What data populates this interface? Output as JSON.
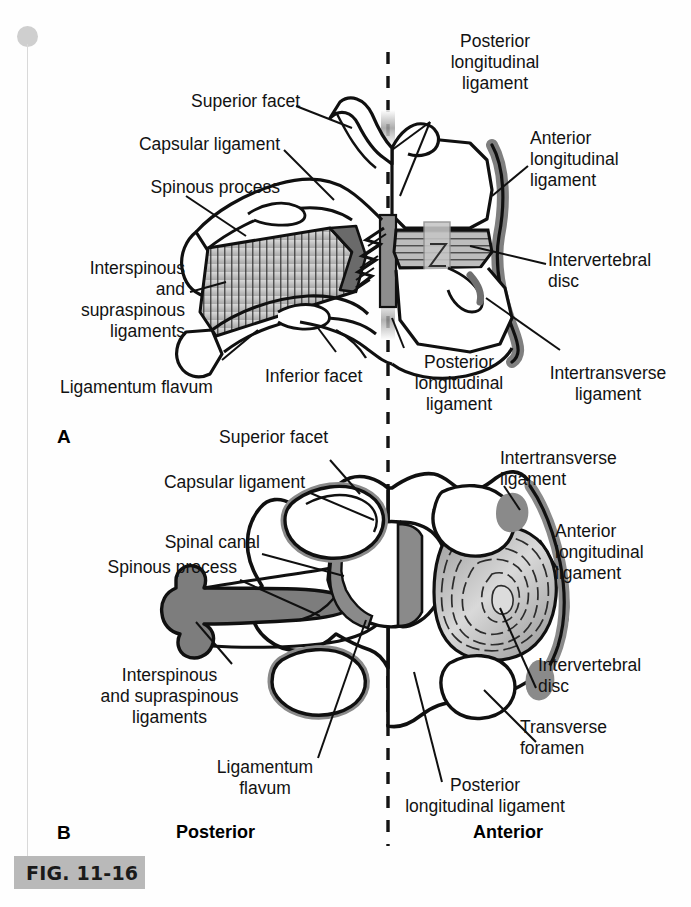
{
  "figure": {
    "caption_tag": "FIG. 11-16",
    "panels": [
      {
        "letter": "A",
        "view": "lateral (sagittal) view of two vertebrae and their ligaments"
      },
      {
        "letter": "B",
        "view": "superior (axial/transverse) view of a cervical vertebra and its ligaments"
      }
    ],
    "midline_note": "vertical dashed line divides posterior (left) from anterior (right)"
  },
  "orientation": {
    "posterior": "Posterior",
    "anterior": "Anterior"
  },
  "panel_a": {
    "letter": "A",
    "labels": {
      "superior_facet": "Superior facet",
      "capsular_ligament": "Capsular ligament",
      "spinous_process": "Spinous process",
      "interspinous_supraspinous": "Interspinous\nand\nsupraspinous\nligaments",
      "ligamentum_flavum": "Ligamentum flavum",
      "inferior_facet": "Inferior facet",
      "posterior_longitudinal_top": "Posterior\nlongitudinal\nligament",
      "posterior_longitudinal_bottom": "Posterior\nlongitudinal\nligament",
      "anterior_longitudinal": "Anterior\nlongitudinal\nligament",
      "intervertebral_disc": "Intervertebral\ndisc",
      "intertransverse_ligament": "Intertransverse\nligament"
    }
  },
  "panel_b": {
    "letter": "B",
    "labels": {
      "superior_facet": "Superior facet",
      "capsular_ligament": "Capsular ligament",
      "spinal_canal": "Spinal canal",
      "spinous_process": "Spinous process",
      "interspinous_supraspinous": "Interspinous\nand supraspinous\nligaments",
      "ligamentum_flavum": "Ligamentum\nflavum",
      "intertransverse_ligament": "Intertransverse\nligament",
      "anterior_longitudinal": "Anterior\nlongitudinal\nligament",
      "intervertebral_disc": "Intervertebral\ndisc",
      "transverse_foramen": "Transverse\nforamen",
      "posterior_longitudinal": "Posterior\nlongitudinal ligament"
    }
  },
  "colors": {
    "ink": "#111111",
    "page": "#ffffff",
    "caption_bar": "#b9b9b9",
    "rail": "#d9d9d9",
    "rail_dot": "#cfcfcf",
    "ligament_gray": "#8a8a8a",
    "disc_gray": "#b4b4b4",
    "hatch_gray": "#c8c8c8"
  }
}
